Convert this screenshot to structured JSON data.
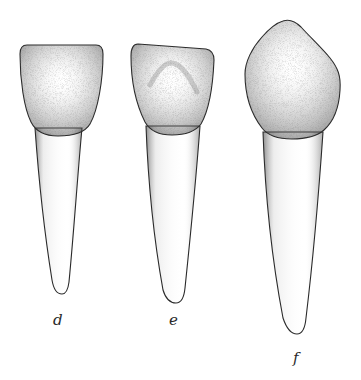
{
  "figure": {
    "colors": {
      "ink": "#2a2a2a",
      "background": "#ffffff",
      "stipple": "#555555"
    },
    "teeth": [
      {
        "id": "d",
        "label": "d"
      },
      {
        "id": "e",
        "label": "e"
      },
      {
        "id": "f",
        "label": "f"
      }
    ]
  }
}
